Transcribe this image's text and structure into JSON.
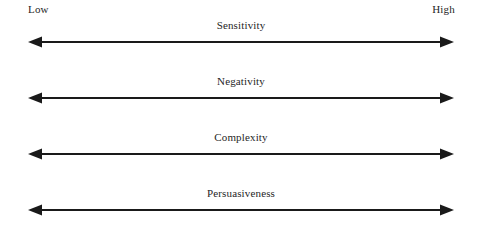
{
  "figure": {
    "background_color": "#ffffff",
    "ink_color": "#1a1a1a",
    "anchors": {
      "left_label": "Low",
      "right_label": "High"
    },
    "scales": [
      {
        "label": "Sensitivity"
      },
      {
        "label": "Negativity"
      },
      {
        "label": "Complexity"
      },
      {
        "label": "Persuasiveness"
      }
    ]
  }
}
